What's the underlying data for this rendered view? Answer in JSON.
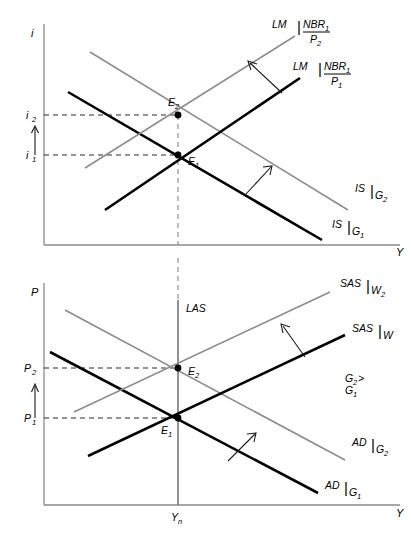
{
  "figure": {
    "panels": [
      {
        "id": "upper",
        "name": "IS-LM panel",
        "y_axis_label": "i",
        "x_axis_label": "Y",
        "y_ticks": [
          {
            "label": "i",
            "sub": "2"
          },
          {
            "label": "i",
            "sub": "1"
          }
        ],
        "equilibria": [
          {
            "label": "E",
            "sub": "2"
          },
          {
            "label": "E",
            "sub": "1"
          }
        ],
        "curves": [
          {
            "name": "LM-shifted",
            "label": "LM",
            "fraction": {
              "numerator": "NBR",
              "numerator_sub": "1",
              "denominator": "P",
              "denominator_sub": "2"
            },
            "color": "#8d8d8d"
          },
          {
            "name": "LM-initial",
            "label": "LM",
            "fraction": {
              "numerator": "NBR",
              "numerator_sub": "1",
              "denominator": "P",
              "denominator_sub": "1"
            },
            "color": "#000000"
          },
          {
            "name": "IS-shifted",
            "label": "IS",
            "sub": "G",
            "sub_sub": "2",
            "color": "#8d8d8d"
          },
          {
            "name": "IS-initial",
            "label": "IS",
            "sub": "G",
            "sub_sub": "1",
            "color": "#000000"
          }
        ]
      },
      {
        "id": "lower",
        "name": "AD-AS panel",
        "y_axis_label": "P",
        "x_axis_label": "Y",
        "x_tick": {
          "label": "Y",
          "sub": "n"
        },
        "y_ticks": [
          {
            "label": "P",
            "sub": "2"
          },
          {
            "label": "P",
            "sub": "1"
          }
        ],
        "equilibria": [
          {
            "label": "E",
            "sub": "2"
          },
          {
            "label": "E",
            "sub": "1"
          }
        ],
        "vertical_curve_label": "LAS",
        "note": {
          "line1_main": "G",
          "line1_sub": "2",
          "line1_tail": " >",
          "line2_main": "G",
          "line2_sub": "1"
        },
        "curves": [
          {
            "name": "SAS-shifted",
            "label": "SAS",
            "sub": "W",
            "sub_sub": "2",
            "color": "#8d8d8d"
          },
          {
            "name": "SAS-initial",
            "label": "SAS",
            "sub": "W",
            "sub_sub": "1",
            "color": "#000000"
          },
          {
            "name": "AD-shifted",
            "label": "AD",
            "sub": "G",
            "sub_sub": "2",
            "color": "#8d8d8d"
          },
          {
            "name": "AD-initial",
            "label": "AD",
            "sub": "G",
            "sub_sub": "1",
            "color": "#000000"
          }
        ]
      }
    ],
    "colors": {
      "curve_initial": "#000000",
      "curve_shifted": "#8d8d8d",
      "axis": "#8a8a8a",
      "background": "#ffffff"
    }
  }
}
